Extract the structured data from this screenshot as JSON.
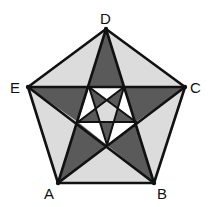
{
  "diagram": {
    "type": "nested-pentagram",
    "colors": {
      "dark": "#5a5a5a",
      "light": "#dcdcdc",
      "white": "#ffffff",
      "line": "#111111"
    },
    "vertices": {
      "A": {
        "label": "A",
        "x": 58,
        "y": 183,
        "lx": 44,
        "ly": 199
      },
      "B": {
        "label": "B",
        "x": 154,
        "y": 183,
        "lx": 157,
        "ly": 199
      },
      "C": {
        "label": "C",
        "x": 185,
        "y": 87,
        "lx": 190,
        "ly": 93
      },
      "D": {
        "label": "D",
        "x": 106,
        "y": 29,
        "lx": 100,
        "ly": 24
      },
      "E": {
        "label": "E",
        "x": 28,
        "y": 87,
        "lx": 10,
        "ly": 93
      }
    },
    "inner_pentagon": {
      "P1": {
        "x": 89,
        "y": 87
      },
      "P2": {
        "x": 124,
        "y": 87
      },
      "P3": {
        "x": 136,
        "y": 122
      },
      "P4": {
        "x": 107,
        "y": 145
      },
      "P5": {
        "x": 78,
        "y": 122
      }
    },
    "labels": [
      "A",
      "B",
      "C",
      "D",
      "E"
    ]
  }
}
